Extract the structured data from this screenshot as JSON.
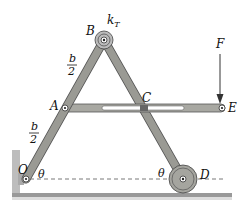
{
  "diagram": {
    "title": "",
    "points": {
      "O": {
        "label": "O",
        "x": 26,
        "y": 179
      },
      "A": {
        "label": "A",
        "x": 65,
        "y": 108
      },
      "B": {
        "label": "B",
        "x": 104,
        "y": 40
      },
      "C": {
        "label": "C",
        "x": 144,
        "y": 108
      },
      "D": {
        "label": "D",
        "x": 183,
        "y": 179
      },
      "E": {
        "label": "E",
        "x": 222,
        "y": 108
      }
    },
    "labels": {
      "spring": "k",
      "spring_sub": "T",
      "force": "F",
      "theta_left": "θ",
      "theta_right": "θ",
      "half_upper_num": "b",
      "half_upper_den": "2",
      "half_lower_num": "b",
      "half_lower_den": "2"
    },
    "colors": {
      "link_fill": "#9a9a94",
      "link_stroke": "#555",
      "slot": "#ffffff",
      "ground": "#888"
    }
  }
}
